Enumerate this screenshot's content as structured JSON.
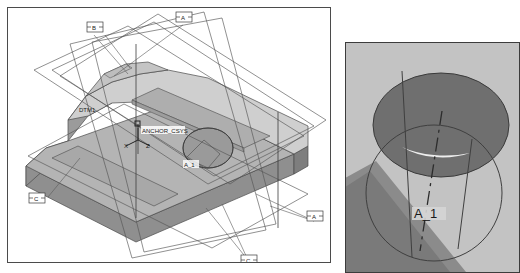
{
  "app": {
    "kind": "cad-viewport-screenshot",
    "panels": 2
  },
  "left_panel": {
    "name": "main-3d-viewport",
    "background_color": "#ffffff",
    "border_color": "#4b4b4b",
    "model": {
      "description": "Shaded isometric solid block with stepped top face, rounded left end, a through hole on the top face and multiple datum planes shown as wireframe rectangles",
      "shade_colors": {
        "top_light": "#d2d2d2",
        "top_mid": "#b9b9b9",
        "side_dark": "#8f8f8f",
        "side_mid": "#a5a5a5",
        "pocket": "#9a9a9a",
        "hole_inner": "#8a8a8a",
        "edge": "#4a4a4a"
      }
    },
    "datum_callouts": [
      {
        "id": "callout-b-top-left",
        "label": "B",
        "x": 86,
        "y": 15
      },
      {
        "id": "callout-a-top-right",
        "label": "A",
        "x": 175,
        "y": 5
      },
      {
        "id": "callout-c-left",
        "label": "C",
        "x": 28,
        "y": 189
      },
      {
        "id": "callout-c-bottom",
        "label": "C",
        "x": 240,
        "y": 257
      },
      {
        "id": "callout-a-right",
        "label": "A",
        "x": 307,
        "y": 209
      }
    ],
    "annotations": [
      {
        "id": "datum-plane-label",
        "text": "DTM1",
        "x": 78,
        "y": 108
      },
      {
        "id": "csys-label",
        "text": "ANCHOR_CSYS",
        "x": 136,
        "y": 125
      },
      {
        "id": "csys-axis-x",
        "text": "X",
        "x": 122,
        "y": 137
      },
      {
        "id": "csys-axis-z",
        "text": "Z",
        "x": 139,
        "y": 137
      },
      {
        "id": "hole-axis-label",
        "text": "A_1",
        "x": 181,
        "y": 163
      }
    ]
  },
  "right_panel": {
    "name": "zoomed-detail-viewport",
    "background_color": "#c3c3c3",
    "border_color": "#3c3c3c",
    "model": {
      "description": "Magnified view of a cylindrical hole: a dark elliptical top face with a circular wireframe cylinder below it and a dash-dot centre axis",
      "shade_colors": {
        "ellipse_fill": "#6d6d6d",
        "ellipse_fill_light": "#8b8b8b",
        "surface_dark": "#777777",
        "highlight": "#e8e8e8",
        "edge": "#3a3a3a"
      }
    },
    "annotations": [
      {
        "id": "hole-axis-label",
        "text": "A_1",
        "x": 74,
        "y": 172
      }
    ]
  }
}
